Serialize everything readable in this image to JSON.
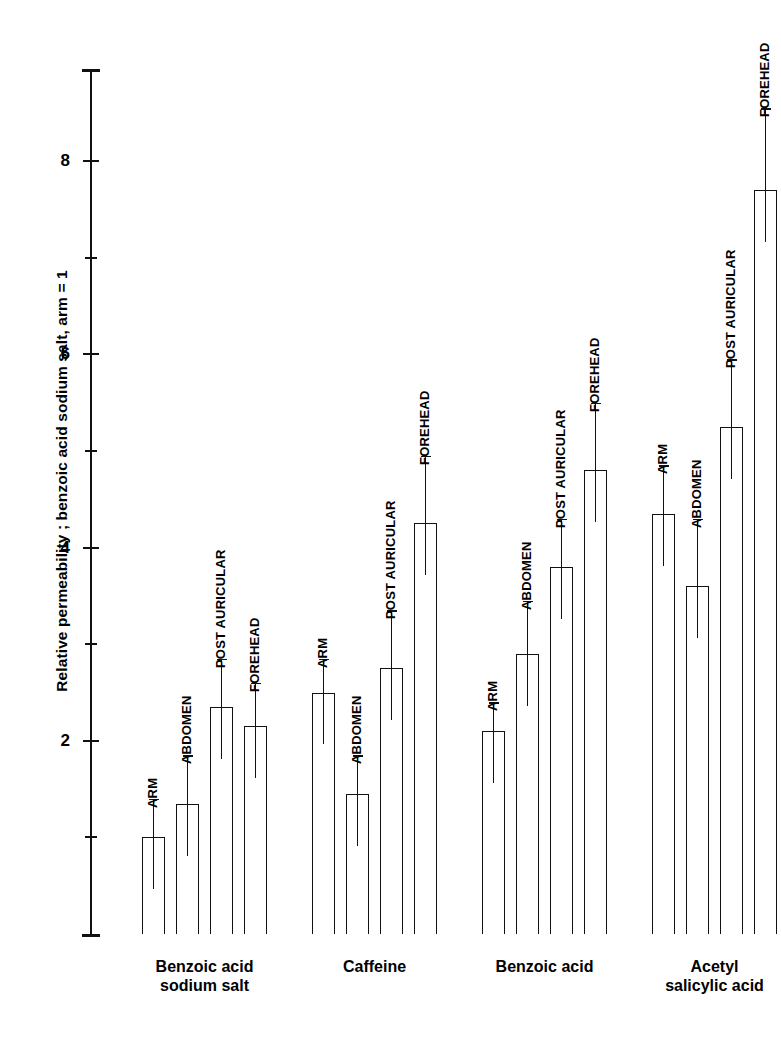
{
  "chart_data": {
    "type": "bar",
    "title": "",
    "subtitle": "",
    "xlabel": "",
    "ylabel": "Relative permeability ; benzoic acid sodium salt, arm = 1",
    "ylim": [
      0,
      8.9
    ],
    "yticks": [
      2,
      4,
      6,
      8
    ],
    "ytick_labels": [
      "2",
      "4",
      "6",
      "8"
    ],
    "minor_ticks": [
      1,
      3,
      5,
      7
    ],
    "grid": false,
    "legend": "none",
    "categories": [
      "Benzoic acid\nsodium salt",
      "Caffeine",
      "Benzoic acid",
      "Acetyl\nsalicylic acid"
    ],
    "site_labels": [
      "ARM",
      "ABDOMEN",
      "POST AURICULAR",
      "FOREHEAD"
    ],
    "groups": [
      {
        "name": "Benzoic acid sodium salt",
        "bars": [
          {
            "site": "ARM",
            "value": 1.0,
            "err_high": 1.4
          },
          {
            "site": "ABDOMEN",
            "value": 1.35,
            "err_high": 1.85
          },
          {
            "site": "POST AURICULAR",
            "value": 2.35,
            "err_high": 2.85
          },
          {
            "site": "FOREHEAD",
            "value": 2.15,
            "err_high": 2.6
          }
        ]
      },
      {
        "name": "Caffeine",
        "bars": [
          {
            "site": "ARM",
            "value": 2.5,
            "err_high": 2.85
          },
          {
            "site": "ABDOMEN",
            "value": 1.45,
            "err_high": 1.85
          },
          {
            "site": "POST AURICULAR",
            "value": 2.75,
            "err_high": 3.35
          },
          {
            "site": "FOREHEAD",
            "value": 4.25,
            "err_high": 4.95
          }
        ]
      },
      {
        "name": "Benzoic acid",
        "bars": [
          {
            "site": "ARM",
            "value": 2.1,
            "err_high": 2.4
          },
          {
            "site": "ABDOMEN",
            "value": 2.9,
            "err_high": 3.45
          },
          {
            "site": "POST AURICULAR",
            "value": 3.8,
            "err_high": 4.3
          },
          {
            "site": "FOREHEAD",
            "value": 4.8,
            "err_high": 5.5
          }
        ]
      },
      {
        "name": "Acetyl salicylic acid",
        "bars": [
          {
            "site": "ARM",
            "value": 4.35,
            "err_high": 4.85
          },
          {
            "site": "ABDOMEN",
            "value": 3.6,
            "err_high": 4.3
          },
          {
            "site": "POST AURICULAR",
            "value": 5.25,
            "err_high": 5.95
          },
          {
            "site": "FOREHEAD",
            "value": 7.7,
            "err_high": 8.55
          }
        ]
      }
    ]
  },
  "axis": {
    "ylabel": "Relative permeability ; benzoic acid sodium salt, arm = 1"
  },
  "groups_caption": [
    "Benzoic acid\nsodium salt",
    "Caffeine",
    "Benzoic acid",
    "Acetyl\nsalicylic acid"
  ]
}
